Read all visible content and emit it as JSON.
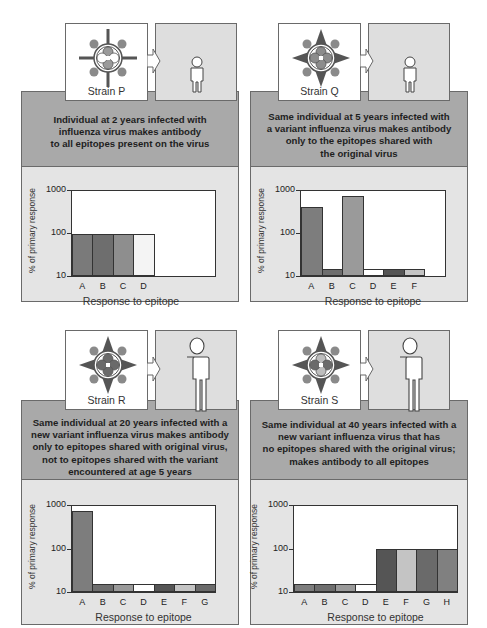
{
  "figure": {
    "panels": [
      {
        "strain": "Strain P",
        "caption_lines": [
          "Individual at 2 years infected with",
          "influenza virus makes antibody",
          "to all epitopes present on the virus"
        ],
        "person_size": "small",
        "virus_style": "cross"
      },
      {
        "strain": "Strain Q",
        "caption_lines": [
          "Same individual at 5 years infected with",
          "a variant influenza virus makes antibody",
          "only to the epitopes shared with",
          "the original virus"
        ],
        "person_size": "small",
        "virus_style": "star"
      },
      {
        "strain": "Strain R",
        "caption_lines": [
          "Same individual at 20 years infected with a",
          "new variant influenza virus makes antibody",
          "only to epitopes shared with original virus,",
          "not to epitopes shared with the variant",
          "encountered at age 5 years"
        ],
        "person_size": "large",
        "virus_style": "star"
      },
      {
        "strain": "Strain S",
        "caption_lines": [
          "Same individual at 40 years infected with a",
          "new variant influenza virus that has",
          "no epitopes shared with the original virus;",
          "makes antibody to all epitopes"
        ],
        "person_size": "large",
        "virus_style": "star"
      }
    ],
    "colors": {
      "caption_panel": "#a9a9a9",
      "chart_panel": "#e4e4e4",
      "person_box": "#dedede",
      "epitope_A": "#7d7d7d",
      "epitope_B": "#6e6e6e",
      "epitope_C": "#9a9a9a",
      "epitope_D": "#ffffff",
      "epitope_E": "#555555",
      "epitope_F": "#c4c4c4",
      "epitope_G": "#6a6a6a",
      "epitope_H": "#808080"
    }
  },
  "chart_data": [
    {
      "type": "bar",
      "title": "Strain P — age 2",
      "xlabel": "Response to epitope",
      "ylabel": "% of primary response",
      "yscale": "log",
      "ylim": [
        10,
        1000
      ],
      "yticks": [
        "1000",
        "100",
        "10"
      ],
      "categories": [
        "A",
        "B",
        "C",
        "D"
      ],
      "values": [
        100,
        100,
        100,
        100
      ],
      "slots": 7
    },
    {
      "type": "bar",
      "title": "Strain Q — age 5",
      "xlabel": "Response to epitope",
      "ylabel": "% of primary response",
      "yscale": "log",
      "ylim": [
        10,
        1000
      ],
      "yticks": [
        "1000",
        "100",
        "10"
      ],
      "categories": [
        "A",
        "B",
        "C",
        "D",
        "E",
        "F"
      ],
      "values": [
        420,
        15,
        750,
        15,
        15,
        15
      ],
      "slots": 7
    },
    {
      "type": "bar",
      "title": "Strain R — age 20",
      "xlabel": "Response to epitope",
      "ylabel": "% of primary response",
      "yscale": "log",
      "ylim": [
        10,
        1000
      ],
      "yticks": [
        "1000",
        "100",
        "10"
      ],
      "categories": [
        "A",
        "B",
        "C",
        "D",
        "E",
        "F",
        "G"
      ],
      "values": [
        750,
        15,
        15,
        15,
        15,
        15,
        15
      ],
      "slots": 7
    },
    {
      "type": "bar",
      "title": "Strain S — age 40",
      "xlabel": "Response to epitope",
      "ylabel": "% of primary response",
      "yscale": "log",
      "ylim": [
        10,
        1000
      ],
      "yticks": [
        "1000",
        "100",
        "10"
      ],
      "categories": [
        "A",
        "B",
        "C",
        "D",
        "E",
        "F",
        "G",
        "H"
      ],
      "values": [
        15,
        15,
        15,
        15,
        100,
        100,
        100,
        100
      ],
      "slots": 8
    }
  ]
}
